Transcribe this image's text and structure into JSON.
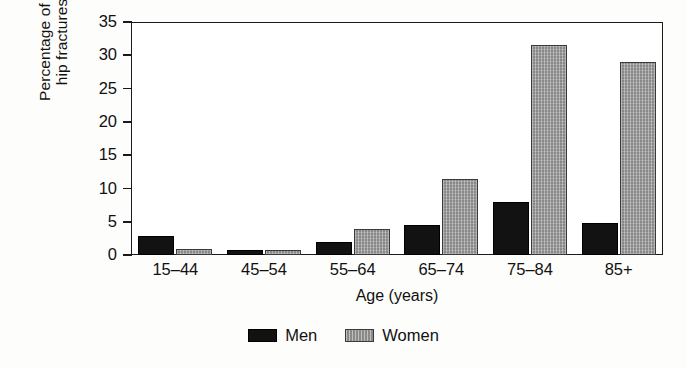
{
  "chart_data": {
    "type": "bar",
    "title": "",
    "xlabel": "Age (years)",
    "ylabel": "Percentage of all\nhip fractures",
    "categories": [
      "15–44",
      "45–54",
      "55–64",
      "65–74",
      "75–84",
      "85+"
    ],
    "series": [
      {
        "name": "Men",
        "color": "#121212",
        "values": [
          2.8,
          0.8,
          1.9,
          4.5,
          7.9,
          4.8
        ]
      },
      {
        "name": "Women",
        "color": "#8a8a8a",
        "values": [
          0.9,
          0.8,
          3.9,
          11.4,
          31.6,
          29.0
        ]
      }
    ],
    "ylim": [
      0,
      35
    ],
    "yticks": [
      0,
      5,
      10,
      15,
      20,
      25,
      30,
      35
    ],
    "ytick_labels": [
      "0",
      "5",
      "10",
      "15",
      "20",
      "25",
      "30",
      "35"
    ],
    "grid": false,
    "legend_position": "bottom-center"
  },
  "legend": {
    "items": [
      {
        "label": "Men",
        "swatch": "men-swatch"
      },
      {
        "label": "Women",
        "swatch": "women-swatch"
      }
    ]
  }
}
